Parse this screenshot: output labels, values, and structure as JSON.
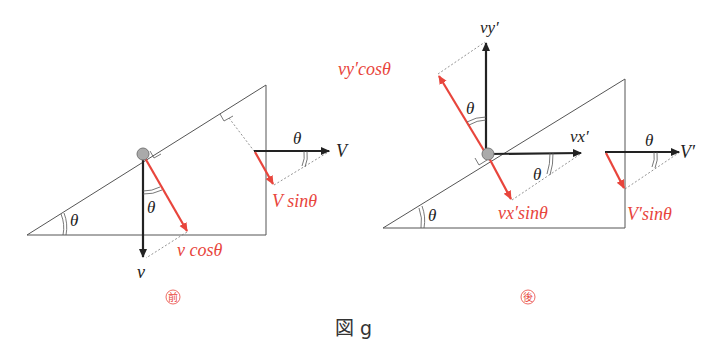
{
  "figure": {
    "caption": "図 g",
    "before_label": "前",
    "after_label": "後",
    "colors": {
      "black": "#222222",
      "red": "#e8453c",
      "line": "#555555",
      "ball": "#aaaaaa"
    }
  },
  "before": {
    "incline_angle": "θ",
    "ball_angle": "θ",
    "block_angle": "θ",
    "velocity_label": "v",
    "normal_component_label": "v cosθ",
    "block_velocity_label": "V",
    "block_normal_component_label": "V sinθ"
  },
  "after": {
    "incline_angle": "θ",
    "vy_angle": "θ",
    "vx_angle": "θ",
    "block_angle": "θ",
    "vy_label": "vy′",
    "vx_label": "vx′",
    "vy_component_label": "vy′cosθ",
    "vx_component_label": "vx′sinθ",
    "block_velocity_label": "V′",
    "block_normal_component_label": "V′sinθ"
  }
}
